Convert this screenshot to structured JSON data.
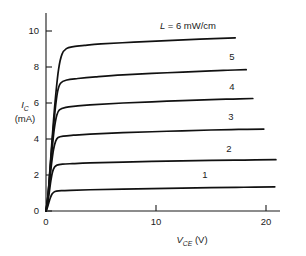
{
  "chart_data": {
    "type": "line",
    "title": "",
    "subtitle": "",
    "xlabel": "V_CE (V)",
    "xlabel_main": "V",
    "xlabel_sub": "CE",
    "xlabel_unit": "(V)",
    "ylabel": "I_C (mA)",
    "ylabel_main": "I",
    "ylabel_sub": "C",
    "ylabel_unit": "(mA)",
    "xlim": [
      0,
      21.5
    ],
    "ylim": [
      0,
      11
    ],
    "xticks": [
      0,
      10,
      20
    ],
    "xticklabels": [
      "0",
      "10",
      "20"
    ],
    "yticks": [
      0,
      2,
      4,
      6,
      8,
      10
    ],
    "yticklabels": [
      "0",
      "2",
      "4",
      "6",
      "8",
      "10"
    ],
    "grid": false,
    "legend_position": "inline-right",
    "annotation_top": "L = 6 mW/cm",
    "annotation_top_symbol": "L",
    "annotation_top_rest": "= 6 mW/cm",
    "series": [
      {
        "name": "1",
        "label": "1",
        "knee_v": 0.75,
        "saturation_ma": 1.12,
        "end_v": 20.8,
        "end_ma": 1.34,
        "points": [
          [
            0,
            0
          ],
          [
            0.12,
            0.18
          ],
          [
            0.25,
            0.45
          ],
          [
            0.4,
            0.74
          ],
          [
            0.55,
            0.94
          ],
          [
            0.72,
            1.05
          ],
          [
            0.95,
            1.1
          ],
          [
            1.4,
            1.13
          ],
          [
            2.2,
            1.15
          ],
          [
            4,
            1.18
          ],
          [
            7,
            1.22
          ],
          [
            11,
            1.26
          ],
          [
            15,
            1.3
          ],
          [
            18,
            1.32
          ],
          [
            20.8,
            1.34
          ]
        ]
      },
      {
        "name": "2",
        "label": "2",
        "knee_v": 0.85,
        "saturation_ma": 2.58,
        "end_v": 20.9,
        "end_ma": 2.85,
        "points": [
          [
            0,
            0
          ],
          [
            0.14,
            0.38
          ],
          [
            0.3,
            1.05
          ],
          [
            0.45,
            1.72
          ],
          [
            0.6,
            2.18
          ],
          [
            0.78,
            2.44
          ],
          [
            1.0,
            2.55
          ],
          [
            1.5,
            2.6
          ],
          [
            2.4,
            2.63
          ],
          [
            4,
            2.67
          ],
          [
            7,
            2.72
          ],
          [
            11,
            2.77
          ],
          [
            15,
            2.81
          ],
          [
            18,
            2.83
          ],
          [
            20.9,
            2.85
          ]
        ]
      },
      {
        "name": "3",
        "label": "3",
        "knee_v": 0.95,
        "saturation_ma": 4.1,
        "end_v": 19.8,
        "end_ma": 4.55,
        "points": [
          [
            0,
            0
          ],
          [
            0.15,
            0.55
          ],
          [
            0.32,
            1.55
          ],
          [
            0.5,
            2.6
          ],
          [
            0.68,
            3.4
          ],
          [
            0.88,
            3.88
          ],
          [
            1.1,
            4.08
          ],
          [
            1.6,
            4.16
          ],
          [
            2.5,
            4.21
          ],
          [
            4,
            4.27
          ],
          [
            7,
            4.35
          ],
          [
            11,
            4.43
          ],
          [
            15,
            4.5
          ],
          [
            17.5,
            4.53
          ],
          [
            19.8,
            4.55
          ]
        ]
      },
      {
        "name": "4",
        "label": "4",
        "knee_v": 1.05,
        "saturation_ma": 5.7,
        "end_v": 18.8,
        "end_ma": 6.25,
        "points": [
          [
            0,
            0
          ],
          [
            0.16,
            0.7
          ],
          [
            0.35,
            2.0
          ],
          [
            0.55,
            3.4
          ],
          [
            0.75,
            4.55
          ],
          [
            0.98,
            5.32
          ],
          [
            1.22,
            5.62
          ],
          [
            1.8,
            5.76
          ],
          [
            2.7,
            5.83
          ],
          [
            4,
            5.9
          ],
          [
            7,
            6.0
          ],
          [
            11,
            6.1
          ],
          [
            15,
            6.19
          ],
          [
            17,
            6.22
          ],
          [
            18.8,
            6.25
          ]
        ]
      },
      {
        "name": "5",
        "label": "5",
        "knee_v": 1.15,
        "saturation_ma": 7.22,
        "end_v": 18.2,
        "end_ma": 7.85,
        "points": [
          [
            0,
            0
          ],
          [
            0.18,
            0.85
          ],
          [
            0.38,
            2.4
          ],
          [
            0.6,
            4.1
          ],
          [
            0.82,
            5.55
          ],
          [
            1.05,
            6.62
          ],
          [
            1.32,
            7.1
          ],
          [
            1.9,
            7.28
          ],
          [
            2.9,
            7.36
          ],
          [
            4.5,
            7.45
          ],
          [
            7,
            7.56
          ],
          [
            11,
            7.68
          ],
          [
            15,
            7.79
          ],
          [
            16.5,
            7.82
          ],
          [
            18.2,
            7.85
          ]
        ]
      },
      {
        "name": "6",
        "label": "L = 6 mW/cm",
        "knee_v": 1.35,
        "saturation_ma": 9.0,
        "end_v": 17.2,
        "end_ma": 9.62,
        "points": [
          [
            0,
            0
          ],
          [
            0.2,
            1.0
          ],
          [
            0.42,
            2.85
          ],
          [
            0.66,
            4.85
          ],
          [
            0.9,
            6.55
          ],
          [
            1.15,
            7.9
          ],
          [
            1.45,
            8.7
          ],
          [
            1.85,
            9.02
          ],
          [
            2.5,
            9.13
          ],
          [
            3.5,
            9.2
          ],
          [
            5,
            9.28
          ],
          [
            8,
            9.38
          ],
          [
            11,
            9.47
          ],
          [
            14,
            9.55
          ],
          [
            17.2,
            9.62
          ]
        ]
      }
    ]
  },
  "axes": {
    "x_origin_px": 46,
    "y_origin_px": 211,
    "x_scale_px_per_unit": 11.0,
    "y_scale_px_per_unit": 18.0,
    "x_axis_end_px": 280,
    "y_axis_top_px": 13
  },
  "curve_label_positions": [
    {
      "label": "1",
      "x_px": 205,
      "y_px": 178
    },
    {
      "label": "2",
      "x_px": 229,
      "y_px": 152
    },
    {
      "label": "3",
      "x_px": 231,
      "y_px": 120
    },
    {
      "label": "4",
      "x_px": 232,
      "y_px": 90
    },
    {
      "label": "5",
      "x_px": 232,
      "y_px": 60
    },
    {
      "label": "L = 6 mW/cm",
      "x_px": 188,
      "y_px": 29
    }
  ]
}
